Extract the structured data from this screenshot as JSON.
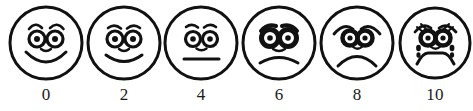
{
  "widget": {
    "name": "wong-baker-faces-pain-rating-scale",
    "type": "faces-pain-rating-scale",
    "background_color": "#ffffff",
    "ink_color": "#111111",
    "face_count": 6
  },
  "faces": [
    {
      "label": "0",
      "icon": "happy-face-icon",
      "expression": "big-smile",
      "center_x": 46,
      "eyebrows": "arched-raised",
      "mouth": "wide-smile",
      "eyes": "round-open",
      "has_nose": true,
      "has_tears": false
    },
    {
      "label": "2",
      "icon": "slightly-happy-face-icon",
      "expression": "smile",
      "center_x": 124,
      "eyebrows": "shallow-arched",
      "mouth": "smile",
      "eyes": "round-open",
      "has_nose": true,
      "has_tears": false
    },
    {
      "label": "4",
      "icon": "neutral-face-icon",
      "expression": "neutral",
      "center_x": 201,
      "eyebrows": "flat-arched",
      "mouth": "straight-line",
      "eyes": "round-open",
      "has_nose": true,
      "has_tears": false
    },
    {
      "label": "6",
      "icon": "worried-face-icon",
      "expression": "frown",
      "center_x": 279,
      "eyebrows": "slanted-worried",
      "mouth": "slight-frown",
      "eyes": "round-shaded",
      "has_nose": true,
      "has_tears": false
    },
    {
      "label": "8",
      "icon": "sad-face-icon",
      "expression": "deep-frown",
      "center_x": 357,
      "eyebrows": "steep-sad",
      "mouth": "deep-frown",
      "eyes": "round-shaded",
      "has_nose": true,
      "has_tears": false
    },
    {
      "label": "10",
      "icon": "crying-face-icon",
      "expression": "crying",
      "center_x": 435,
      "eyebrows": "steep-sad-hatched",
      "mouth": "open-frown",
      "eyes": "round-shaded",
      "has_nose": true,
      "has_tears": true
    }
  ]
}
